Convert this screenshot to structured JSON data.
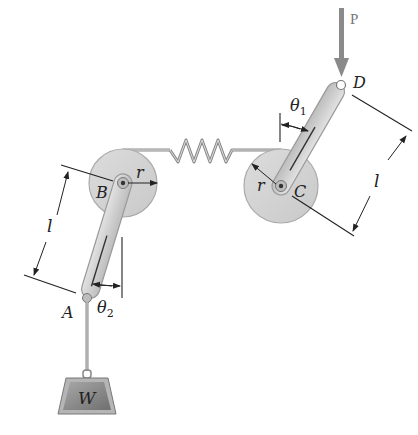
{
  "figure": {
    "type": "mechanism-diagram"
  },
  "labels": {
    "force": "P",
    "point_a": "A",
    "point_b": "B",
    "point_c": "C",
    "point_d": "D",
    "radius_b": "r",
    "radius_c": "r",
    "length_left": "l",
    "length_right": "l",
    "theta1_symbol": "θ",
    "theta1_sub": "1",
    "theta2_symbol": "θ",
    "theta2_sub": "2",
    "weight": "W"
  },
  "colors": {
    "disk_fill": "#d4d4d4",
    "disk_stroke": "#aaaaaa",
    "link_fill": "#cfcfcf",
    "link_stroke": "#999999",
    "force_arrow": "#8a8a8a",
    "weight_fill": "#8c8c8c",
    "dimension_line": "#222222",
    "spring": "#888888"
  }
}
